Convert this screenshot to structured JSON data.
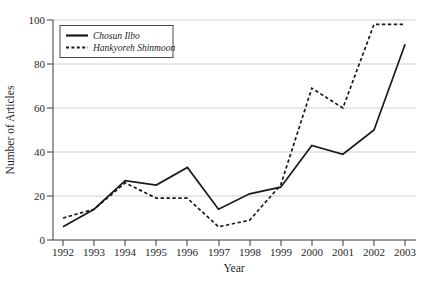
{
  "figure": {
    "ylabel": "Number of Articles",
    "xlabel": "Year"
  },
  "legend": {
    "items": [
      {
        "label": "Chosun Ilbo",
        "style": "solid"
      },
      {
        "label": "Hankyoreh Shinmoon",
        "style": "dashed"
      }
    ]
  },
  "chart_data": {
    "type": "line",
    "categories": [
      1992,
      1993,
      1994,
      1995,
      1996,
      1997,
      1998,
      1999,
      2000,
      2001,
      2002,
      2003
    ],
    "series": [
      {
        "name": "Chosun Ilbo",
        "line_style": "solid",
        "color": "#1a1a1a",
        "values": [
          6,
          14,
          27,
          25,
          33,
          14,
          21,
          24,
          43,
          39,
          50,
          89
        ]
      },
      {
        "name": "Hankyoreh Shinmoon",
        "line_style": "dashed",
        "color": "#1a1a1a",
        "values": [
          10,
          14,
          26,
          19,
          19,
          6,
          9,
          25,
          69,
          60,
          98,
          98
        ]
      }
    ],
    "title": "",
    "xlabel": "Year",
    "ylabel": "Number of Articles",
    "ylim": [
      0,
      100
    ],
    "yticks": [
      0,
      20,
      40,
      60,
      80,
      100
    ],
    "grid": "horizontal",
    "gridline_color": "#cfcfcf",
    "legend_position": "top-left"
  }
}
